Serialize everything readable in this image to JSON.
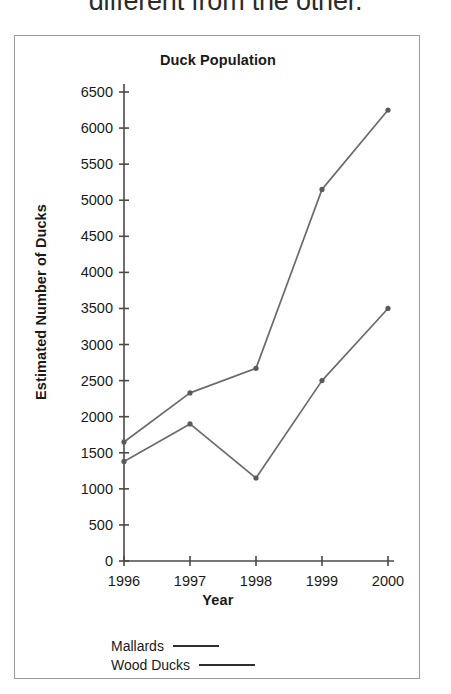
{
  "header": {
    "cut_off_text": "different from the other."
  },
  "legend": {
    "position": "below-plot",
    "entries": [
      {
        "label": "Mallards",
        "swatch": "line-swatch"
      },
      {
        "label": "Wood Ducks",
        "swatch": "line-swatch"
      }
    ]
  },
  "chart_data": {
    "type": "line",
    "title": "Duck Population",
    "xlabel": "Year",
    "ylabel": "Estimated Number of Ducks",
    "categories": [
      "1996",
      "1997",
      "1998",
      "1999",
      "2000"
    ],
    "x": [
      1996,
      1997,
      1998,
      1999,
      2000
    ],
    "series": [
      {
        "name": "Mallards",
        "values": [
          1650,
          2330,
          2670,
          5150,
          6250
        ],
        "color": "#6b6b6b"
      },
      {
        "name": "Wood Ducks",
        "values": [
          1380,
          1900,
          1150,
          2500,
          3500
        ],
        "color": "#6b6b6b"
      }
    ],
    "ylim": [
      0,
      6500
    ],
    "ytick_step": 500,
    "ytick_labels": [
      "0",
      "500",
      "1000",
      "1500",
      "2000",
      "2500",
      "3000",
      "3500",
      "4000",
      "4500",
      "5000",
      "5500",
      "6000",
      "6500"
    ],
    "xtick_labels": [
      "1996",
      "1997",
      "1998",
      "1999",
      "2000"
    ],
    "grid": false,
    "markers": true,
    "legend_position": "bottom-left"
  }
}
